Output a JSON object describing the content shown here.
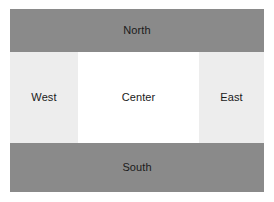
{
  "diagram": {
    "colors": {
      "edge_region_fill": "#8a8a8a",
      "side_region_fill": "#ededed",
      "center_region_fill": "#ffffff",
      "page_background": "#ffffff",
      "label_text": "#1a1a1a"
    },
    "regions": {
      "north": {
        "label": "North"
      },
      "west": {
        "label": "West"
      },
      "center": {
        "label": "Center"
      },
      "east": {
        "label": "East"
      },
      "south": {
        "label": "South"
      }
    }
  }
}
